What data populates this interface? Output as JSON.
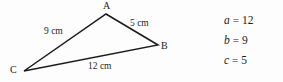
{
  "figure": {
    "type": "geometry-diagram",
    "background_color": "#fdfdfd",
    "stroke_color": "#1b1b1b",
    "text_color": "#1b1b1b"
  },
  "triangle": {
    "vertices": [
      {
        "name": "A",
        "label": "A",
        "x": 106,
        "y": 14,
        "label_x": 103,
        "label_y": 1
      },
      {
        "name": "B",
        "label": "B",
        "x": 158,
        "y": 45,
        "label_x": 161,
        "label_y": 41
      },
      {
        "name": "C",
        "label": "C",
        "x": 24,
        "y": 71,
        "label_x": 10,
        "label_y": 65
      }
    ],
    "sides": [
      {
        "name": "side-ca",
        "from": "C",
        "to": "A",
        "label": "9 cm",
        "label_x": 44,
        "label_y": 27
      },
      {
        "name": "side-ab",
        "from": "A",
        "to": "B",
        "label": "5 cm",
        "label_x": 130,
        "label_y": 19
      },
      {
        "name": "side-cb",
        "from": "C",
        "to": "B",
        "label": "12 cm",
        "label_x": 88,
        "label_y": 62
      }
    ]
  },
  "equations": [
    {
      "variable": "a",
      "operator": "=",
      "value": "12"
    },
    {
      "variable": "b",
      "operator": "=",
      "value": "9"
    },
    {
      "variable": "c",
      "operator": "=",
      "value": "5"
    }
  ],
  "chart_data": {
    "type": "table",
    "title": "",
    "categories": [
      "a",
      "b",
      "c"
    ],
    "values": [
      12,
      9,
      5
    ],
    "annotations": [
      "9 cm",
      "5 cm",
      "12 cm",
      "A",
      "B",
      "C"
    ]
  }
}
